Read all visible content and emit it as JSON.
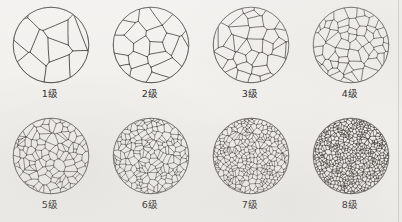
{
  "figure": {
    "title": "",
    "type": "grain-size-comparison-chart",
    "background_color": "#f2f1ee",
    "line_color": "#3a3733",
    "columns": 4,
    "rows": 2
  },
  "panels": [
    {
      "id": "grade-1",
      "label": "1级",
      "grade": 1,
      "grain_count": 9,
      "line_width": 0.85,
      "seed": 11,
      "fill": "none",
      "jitter": 0.42
    },
    {
      "id": "grade-2",
      "label": "2级",
      "grade": 2,
      "grain_count": 17,
      "line_width": 0.8,
      "seed": 23,
      "fill": "none",
      "jitter": 0.4
    },
    {
      "id": "grade-3",
      "label": "3级",
      "grade": 3,
      "grain_count": 30,
      "line_width": 0.72,
      "seed": 37,
      "fill": "none",
      "jitter": 0.38
    },
    {
      "id": "grade-4",
      "label": "4级",
      "grade": 4,
      "grain_count": 52,
      "line_width": 0.66,
      "seed": 59,
      "fill": "none",
      "jitter": 0.36
    },
    {
      "id": "grade-5",
      "label": "5级",
      "grade": 5,
      "grain_count": 92,
      "line_width": 0.6,
      "seed": 71,
      "fill": "none",
      "jitter": 0.34
    },
    {
      "id": "grade-6",
      "label": "6级",
      "grade": 6,
      "grain_count": 165,
      "line_width": 0.54,
      "seed": 97,
      "fill": "none",
      "jitter": 0.32
    },
    {
      "id": "grade-7",
      "label": "7级",
      "grade": 7,
      "grain_count": 290,
      "line_width": 0.5,
      "seed": 131,
      "fill": "none",
      "jitter": 0.3
    },
    {
      "id": "grade-8",
      "label": "8级",
      "grade": 8,
      "grain_count": 520,
      "line_width": 0.62,
      "seed": 167,
      "fill": "none",
      "jitter": 0.28
    }
  ],
  "chart_data": {
    "type": "table",
    "categories": [
      "1级",
      "2级",
      "3级",
      "4级",
      "5级",
      "6级",
      "7级",
      "8级"
    ],
    "values": [
      9,
      17,
      30,
      52,
      92,
      165,
      290,
      520
    ],
    "xlabel": "晶粒度级别 (grain size grade)",
    "ylabel": "视场内晶粒数 (grains per field)",
    "legend": [],
    "grid": false
  }
}
